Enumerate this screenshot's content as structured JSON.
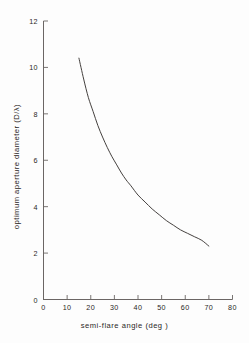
{
  "chart_data": {
    "type": "line",
    "title": "",
    "xlabel": "semi-flare angle (deg )",
    "ylabel": "optimum aperture diameter (D/λ)",
    "xlim": [
      0,
      80
    ],
    "ylim": [
      0,
      12
    ],
    "xticks": [
      0,
      10,
      20,
      30,
      40,
      50,
      60,
      70,
      80
    ],
    "yticks": [
      0,
      2,
      4,
      6,
      8,
      10,
      12
    ],
    "xtick_labels": [
      "0",
      "10",
      "20",
      "30",
      "40",
      "50",
      "60",
      "70",
      "80"
    ],
    "ytick_labels": [
      "0",
      "2",
      "4",
      "6",
      "8",
      "10",
      "12"
    ],
    "grid": false,
    "legend": null,
    "series": [
      {
        "name": "optimum aperture diameter",
        "x": [
          15,
          17,
          19,
          21,
          23,
          25,
          27,
          29,
          31,
          33,
          35,
          37,
          40,
          43,
          46,
          49,
          52,
          55,
          58,
          61,
          64,
          67,
          70
        ],
        "y": [
          10.4,
          9.5,
          8.7,
          8.1,
          7.5,
          7.0,
          6.55,
          6.15,
          5.8,
          5.45,
          5.15,
          4.9,
          4.5,
          4.2,
          3.9,
          3.65,
          3.4,
          3.2,
          3.0,
          2.85,
          2.7,
          2.55,
          2.3
        ]
      }
    ],
    "curve_color": "#3a3634",
    "axis_color": "#6b6664",
    "text_color": "#2b2725",
    "background": "#fdfdfd"
  },
  "axes": {
    "x_axis_name": "semi-flare angle axis",
    "y_axis_name": "optimum aperture diameter axis"
  }
}
